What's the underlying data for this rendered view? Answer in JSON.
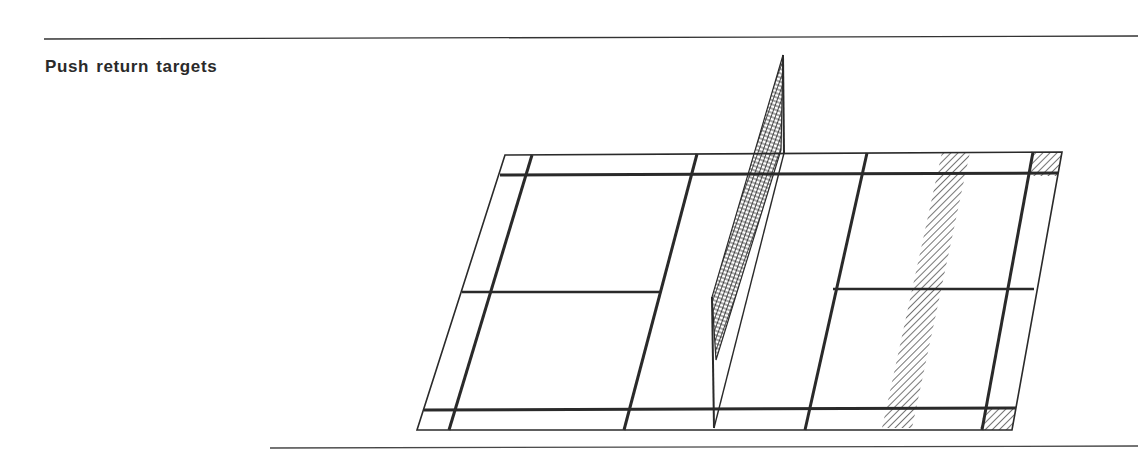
{
  "figure": {
    "title": "Push return targets",
    "elements": [
      {
        "name": "court-outline",
        "kind": "boundary"
      },
      {
        "name": "net",
        "kind": "net-mesh"
      },
      {
        "name": "target-zone-rear-tramline",
        "kind": "hatched-target"
      },
      {
        "name": "target-zone-corner-top",
        "kind": "hatched-target"
      },
      {
        "name": "target-zone-corner-bottom",
        "kind": "hatched-target"
      }
    ],
    "colors": {
      "ink": "#2a2a2a",
      "background": "#ffffff"
    }
  }
}
